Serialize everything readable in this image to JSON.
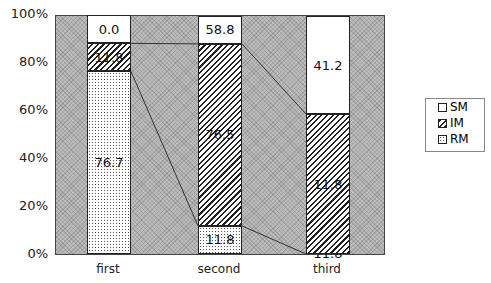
{
  "chart_data": {
    "type": "bar",
    "stacked": true,
    "percent": true,
    "title": "",
    "xlabel": "",
    "ylabel": "",
    "ylim": [
      0,
      100
    ],
    "yticks": [
      "0%",
      "20%",
      "40%",
      "60%",
      "80%",
      "100%"
    ],
    "categories": [
      "first",
      "second",
      "third"
    ],
    "series": [
      {
        "name": "RM",
        "values": [
          76.7,
          11.8,
          0.0
        ]
      },
      {
        "name": "IM",
        "values": [
          11.8,
          76.5,
          58.8
        ]
      },
      {
        "name": "SM",
        "values": [
          11.8,
          11.8,
          41.2
        ]
      }
    ],
    "data_labels": [
      [
        "76.7",
        "11.8",
        "11.8"
      ],
      [
        "11.8",
        "76.5",
        "11.8"
      ],
      [
        "0.0",
        "58.8",
        "41.2"
      ]
    ],
    "legend": [
      "SM",
      "IM",
      "RM"
    ],
    "legend_position": "right",
    "series_lines": true
  }
}
